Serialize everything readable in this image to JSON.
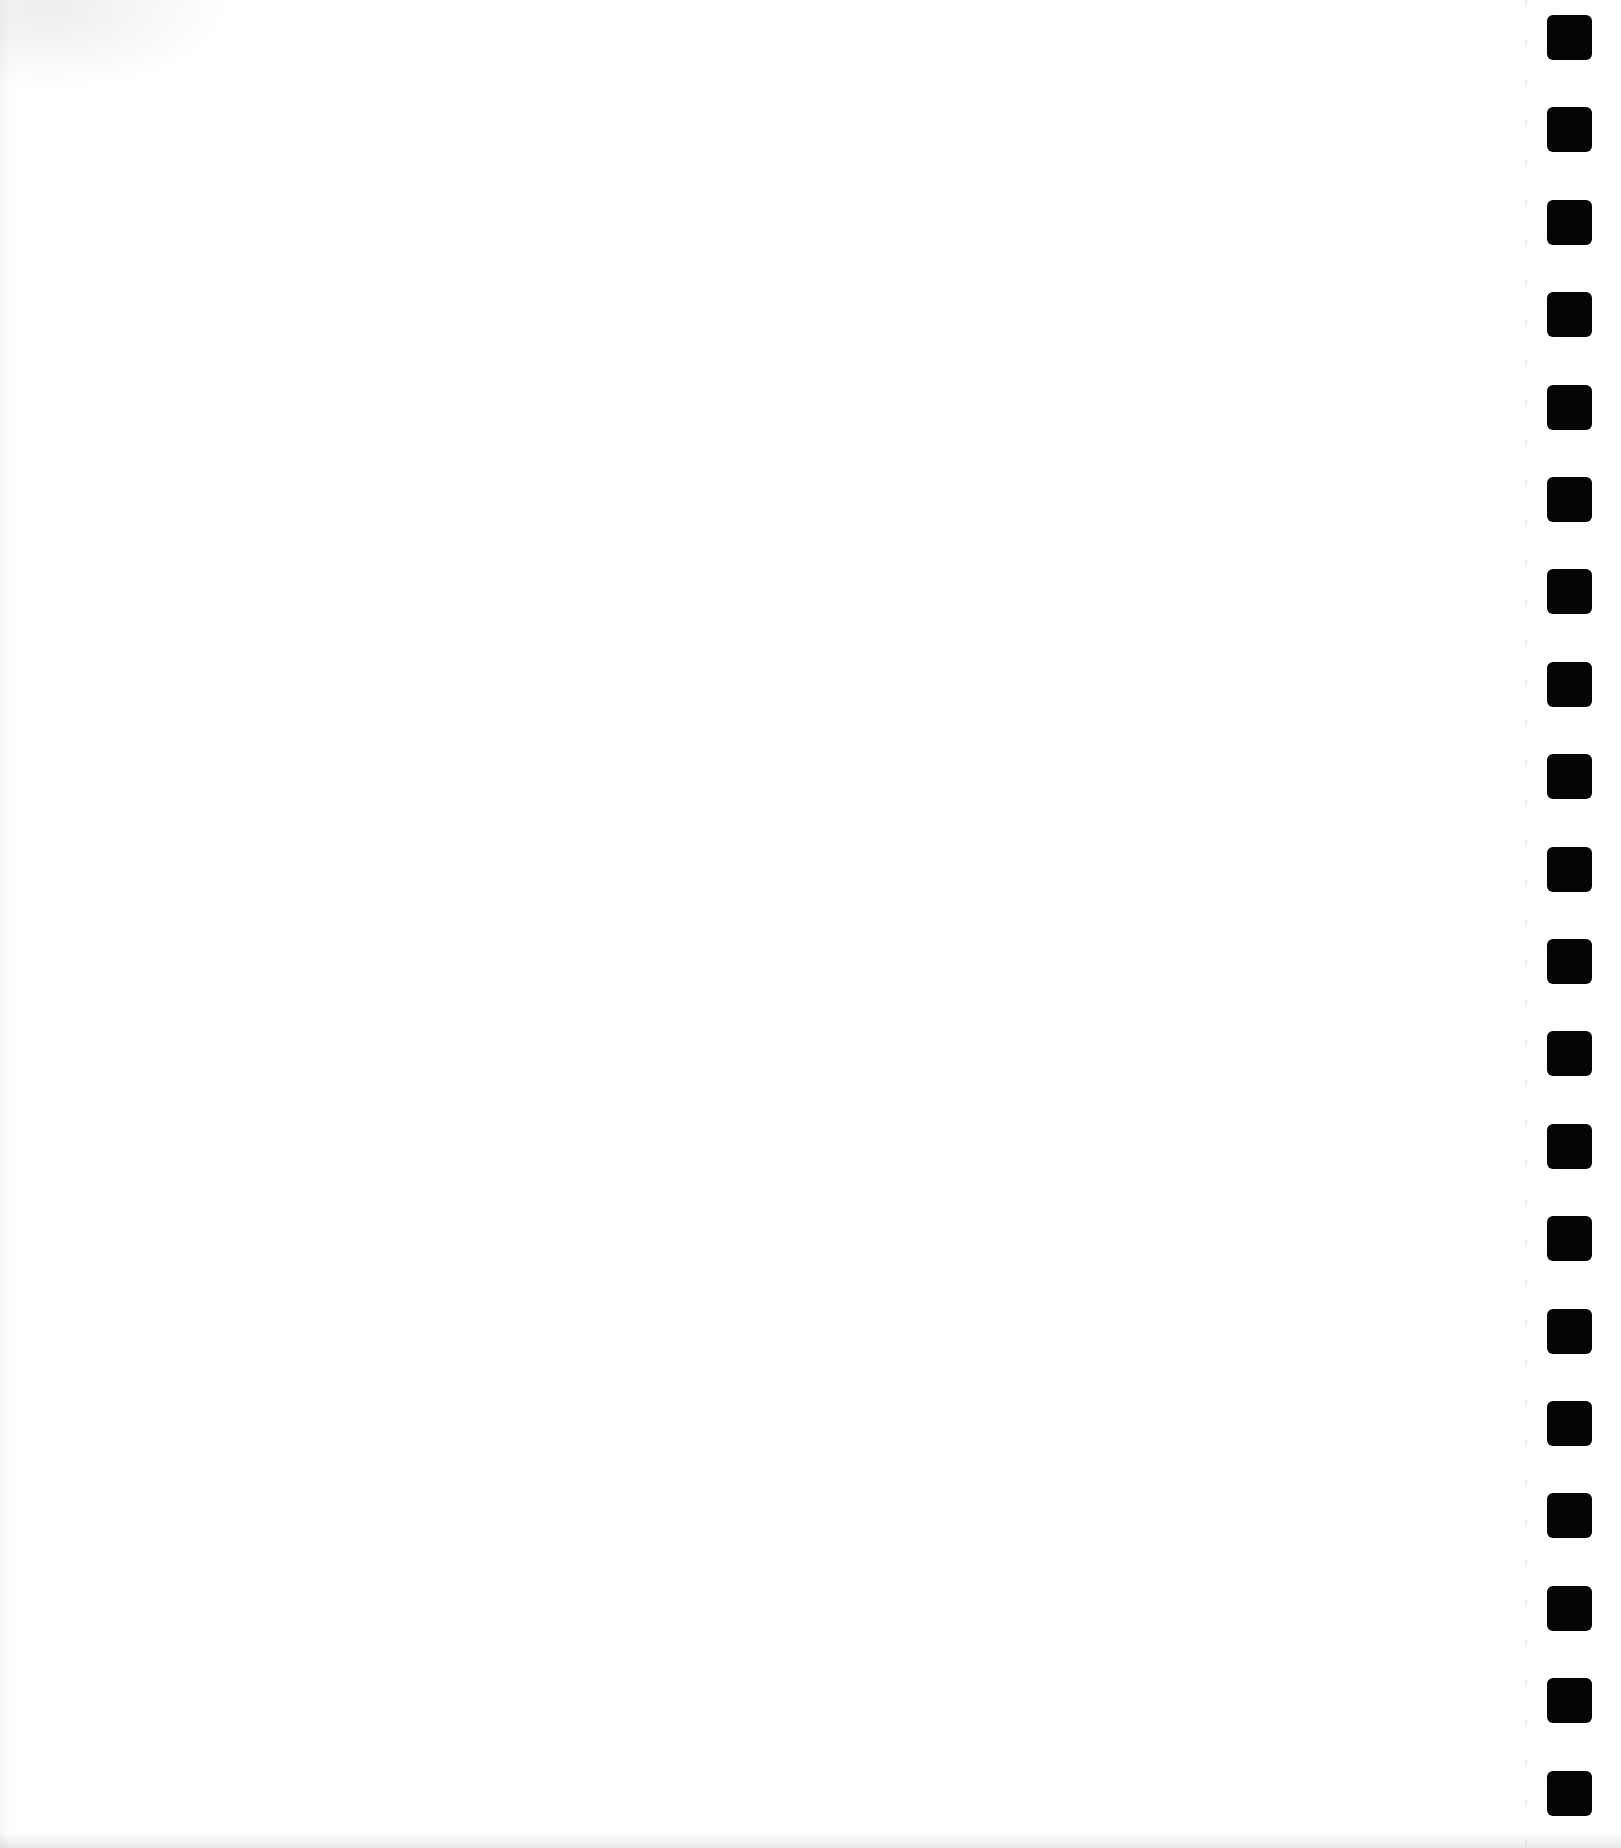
{
  "document": {
    "type": "blank spiral notebook page",
    "text_content": "",
    "paper_color": "#ffffff",
    "binding": {
      "side": "right",
      "hole_count": 20,
      "hole_color": "#050505",
      "hole_size_px": 45,
      "first_hole_top_px": 15,
      "hole_spacing_px": 92.4
    }
  }
}
